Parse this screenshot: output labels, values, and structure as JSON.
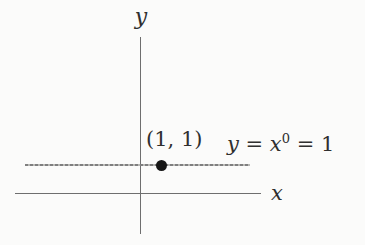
{
  "figure": {
    "background_color": "#fbfbfa",
    "axis_color": "#6e6e6e",
    "constant_line_color": "#8c8c8c",
    "point_color": "#161616"
  },
  "labels": {
    "y_axis": "y",
    "x_axis": "x",
    "point": "(1, 1)",
    "equation": {
      "lhs": "y",
      "eq1": " = ",
      "base": "x",
      "exponent": "0",
      "rhs": " = 1"
    }
  },
  "chart_data": {
    "type": "line",
    "title": "",
    "xlabel": "x",
    "ylabel": "y",
    "series": [
      {
        "name": "y = x^0 = 1",
        "x": [
          -5.2,
          5.0
        ],
        "y": [
          1,
          1
        ],
        "style": "dashed-gray-horizontal"
      }
    ],
    "points": [
      {
        "x": 1,
        "y": 1,
        "label": "(1, 1)",
        "marker": "filled-circle"
      }
    ],
    "annotations": [
      {
        "text": "(1, 1)",
        "attached_to": "point (1,1)",
        "position": "above-point"
      },
      {
        "text": "y = x^0 = 1",
        "attached_to": "line y=1",
        "position": "right-of-line"
      }
    ],
    "axes": {
      "x_range_shown": [
        -5.7,
        5.5
      ],
      "y_range_shown": [
        -1.5,
        5.8
      ],
      "ticks": "none",
      "tick_labels": "none",
      "grid": false,
      "arrowheads": false
    },
    "legend": "none"
  }
}
